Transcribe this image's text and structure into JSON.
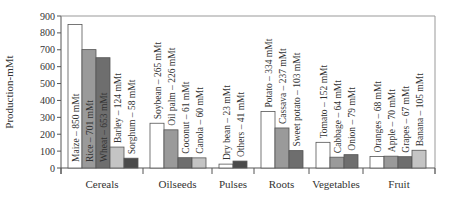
{
  "chart_data": {
    "type": "bar",
    "title": "",
    "xlabel": "",
    "ylabel": "Production-mMt",
    "ylim": [
      0,
      900
    ],
    "yticks": [
      0,
      100,
      200,
      300,
      400,
      500,
      600,
      700,
      800,
      900
    ],
    "grid": false,
    "groups": [
      {
        "name": "Cereals",
        "items": [
          {
            "label": "Maize – 850 mMt",
            "name": "Maize",
            "value": 850,
            "color": "#ffffff"
          },
          {
            "label": "Rice – 701 mMt",
            "name": "Rice",
            "value": 701,
            "color": "#9a9a9a"
          },
          {
            "label": "Wheat – 653 mMt",
            "name": "Wheat",
            "value": 653,
            "color": "#6e6e6e"
          },
          {
            "label": "Barley – 124 mMt",
            "name": "Barley",
            "value": 124,
            "color": "#c4c4c4"
          },
          {
            "label": "Sorghum – 58 mMt",
            "name": "Sorghum",
            "value": 58,
            "color": "#4a4a4a"
          }
        ]
      },
      {
        "name": "Oilseeds",
        "items": [
          {
            "label": "Soybean – 265 mMt",
            "name": "Soybean",
            "value": 265,
            "color": "#ffffff"
          },
          {
            "label": "Oil palm – 226 mMt",
            "name": "Oil palm",
            "value": 226,
            "color": "#9a9a9a"
          },
          {
            "label": "Coconut – 61 mMt",
            "name": "Coconut",
            "value": 61,
            "color": "#6e6e6e"
          },
          {
            "label": "Canola – 60 mMt",
            "name": "Canola",
            "value": 60,
            "color": "#c4c4c4"
          }
        ]
      },
      {
        "name": "Pulses",
        "items": [
          {
            "label": "Dry bean – 23 mMt",
            "name": "Dry bean",
            "value": 23,
            "color": "#ffffff"
          },
          {
            "label": "Others – 41 mMt",
            "name": "Others",
            "value": 41,
            "color": "#4a4a4a"
          }
        ]
      },
      {
        "name": "Roots",
        "items": [
          {
            "label": "Potato – 334 mMt",
            "name": "Potato",
            "value": 334,
            "color": "#ffffff"
          },
          {
            "label": "Cassava – 237 mMt",
            "name": "Cassava",
            "value": 237,
            "color": "#9a9a9a"
          },
          {
            "label": "Sweet potato – 103 mMt",
            "name": "Sweet potato",
            "value": 103,
            "color": "#6e6e6e"
          }
        ]
      },
      {
        "name": "Vegetables",
        "items": [
          {
            "label": "Tomato – 152 mMt",
            "name": "Tomato",
            "value": 152,
            "color": "#ffffff"
          },
          {
            "label": "Cabbage – 64 mMt",
            "name": "Cabbage",
            "value": 64,
            "color": "#9a9a9a"
          },
          {
            "label": "Onion – 79 mMt",
            "name": "Onion",
            "value": 79,
            "color": "#6e6e6e"
          }
        ]
      },
      {
        "name": "Fruit",
        "items": [
          {
            "label": "Oranges – 68 mMt",
            "name": "Oranges",
            "value": 68,
            "color": "#ffffff"
          },
          {
            "label": "Apple – 70 mMt",
            "name": "Apple",
            "value": 70,
            "color": "#9a9a9a"
          },
          {
            "label": "Grapes – 67 mMt",
            "name": "Grapes",
            "value": 67,
            "color": "#6e6e6e"
          },
          {
            "label": "Banana – 105 mMt",
            "name": "Banana",
            "value": 105,
            "color": "#c4c4c4"
          }
        ]
      }
    ]
  }
}
